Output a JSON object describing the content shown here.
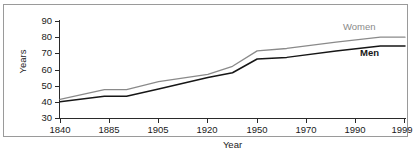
{
  "chart_data": {
    "type": "line",
    "title": "",
    "xlabel": "Year",
    "ylabel": "Years",
    "categories": [
      "1840",
      "1885",
      "1905",
      "1920",
      "1950",
      "1970",
      "1990",
      "1999"
    ],
    "x_positions": [
      0,
      1,
      2,
      3,
      4,
      5,
      6,
      7
    ],
    "ylim": [
      30,
      90
    ],
    "yticks": [
      30,
      40,
      50,
      60,
      70,
      80,
      90
    ],
    "xlim": [
      0,
      7
    ],
    "grid": false,
    "legend_position": "inline-right-end-of-lines",
    "series": [
      {
        "name": "Women",
        "color": "#8a8a8a",
        "x": [
          0,
          0.9,
          1.35,
          2,
          3,
          3.5,
          4,
          4.6,
          5.6,
          6.5,
          7
        ],
        "values": [
          41.5,
          47.5,
          47.5,
          52.5,
          57,
          62,
          71.5,
          73,
          77,
          80,
          80
        ]
      },
      {
        "name": "Men",
        "color": "#161616",
        "x": [
          0,
          0.9,
          1.35,
          2,
          3,
          3.5,
          4,
          4.6,
          5.6,
          6.5,
          7
        ],
        "values": [
          40,
          43.5,
          43.5,
          48,
          55,
          58,
          66.5,
          67.5,
          71.5,
          74.5,
          74.5
        ]
      }
    ],
    "annotations": [
      {
        "text": "Women",
        "color": "#8a8a8a"
      },
      {
        "text": "Men",
        "color": "#161616"
      }
    ]
  },
  "axes": {
    "y_tick_labels": [
      "90",
      "80",
      "70",
      "60",
      "50",
      "40",
      "30"
    ],
    "x_tick_labels": [
      "1840",
      "1885",
      "1905",
      "1920",
      "1950",
      "1970",
      "1990",
      "1999"
    ],
    "y_axis_title": "Years",
    "x_axis_title": "Year"
  },
  "legend": {
    "women_label": "Women",
    "men_label": "Men"
  },
  "colors": {
    "women_line": "#8a8a8a",
    "men_line": "#161616",
    "axis": "#2a2a2a",
    "frame": "#9a9a9a",
    "background": "#ffffff"
  }
}
